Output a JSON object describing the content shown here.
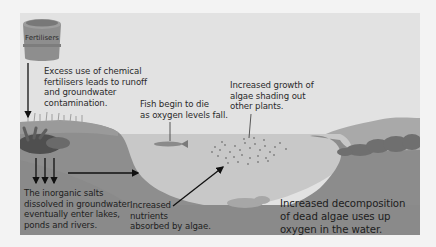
{
  "diagram": {
    "topic": "Eutrophication",
    "barrel": {
      "label": "Fertilisers"
    },
    "annotations": {
      "runoff": "Excess use of chemical\nfertilisers leads to runoff\nand groundwater\ncontamination.",
      "fish": "Fish begin to die\nas oxygen levels fall.",
      "algae_growth": "Increased growth of\nalgae shading out\nother plants.",
      "inorganic_salts": "The inorganic salts\ndissolved in groundwater\neventually enter lakes,\nponds and rivers.",
      "nutrients": "Increased\nnutrients\nabsorbed by algae.",
      "decomposition": "Increased decomposition\nof dead algae uses up\noxygen in the water."
    },
    "colors": {
      "page_bg": "#f3f3f3",
      "sky": "#e2e2e2",
      "water": "#c9c9c9",
      "bank": "#8f8f8f",
      "bank_dark": "#7a7a7a",
      "far_hill": "#a8a8a8",
      "text": "#2a2a2a"
    }
  }
}
